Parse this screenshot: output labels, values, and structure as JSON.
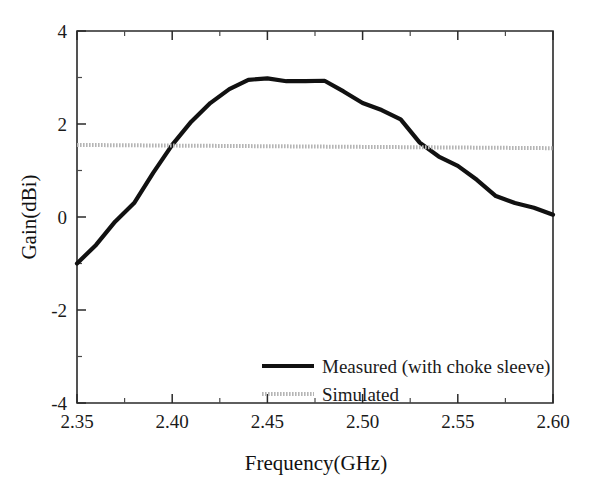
{
  "chart_data": {
    "type": "line",
    "title": "",
    "xlabel": "Frequency(GHz)",
    "ylabel": "Gain(dBi)",
    "xlim": [
      2.35,
      2.6
    ],
    "ylim": [
      -4,
      4
    ],
    "grid": false,
    "legend_position": "bottom-center",
    "x_ticks": [
      "2.35",
      "2.40",
      "2.45",
      "2.50",
      "2.55",
      "2.60"
    ],
    "x_tick_values": [
      2.35,
      2.4,
      2.45,
      2.5,
      2.55,
      2.6
    ],
    "x_minor_step": 0.025,
    "y_ticks": [
      "4",
      "2",
      "0",
      "-2",
      "-4"
    ],
    "y_tick_values": [
      4,
      2,
      0,
      -2,
      -4
    ],
    "y_minor_step": 1,
    "series": [
      {
        "name": "Measured (with choke sleeve)",
        "color": "#111111",
        "style": "solid-thick",
        "x": [
          2.35,
          2.36,
          2.37,
          2.38,
          2.39,
          2.4,
          2.41,
          2.42,
          2.43,
          2.44,
          2.45,
          2.46,
          2.47,
          2.48,
          2.49,
          2.5,
          2.51,
          2.52,
          2.53,
          2.54,
          2.55,
          2.56,
          2.57,
          2.58,
          2.59,
          2.6
        ],
        "values": [
          -1.0,
          -0.6,
          -0.1,
          0.3,
          0.95,
          1.55,
          2.05,
          2.45,
          2.75,
          2.95,
          2.98,
          2.92,
          2.92,
          2.93,
          2.7,
          2.45,
          2.3,
          2.1,
          1.6,
          1.3,
          1.1,
          0.8,
          0.45,
          0.3,
          0.2,
          0.05
        ]
      },
      {
        "name": "Simulated",
        "color": "#b5b5b5",
        "style": "dotted-thick",
        "x": [
          2.35,
          2.6
        ],
        "values": [
          1.55,
          1.48
        ]
      }
    ]
  },
  "legend": {
    "entries": [
      {
        "label": "Measured (with choke sleeve)",
        "swatch": "solid-black-line"
      },
      {
        "label": "Simulated",
        "swatch": "dotted-gray-line"
      }
    ]
  },
  "colors": {
    "measured": "#111111",
    "simulated": "#b5b5b5",
    "axis": "#2a2a2a",
    "background": "#ffffff"
  }
}
